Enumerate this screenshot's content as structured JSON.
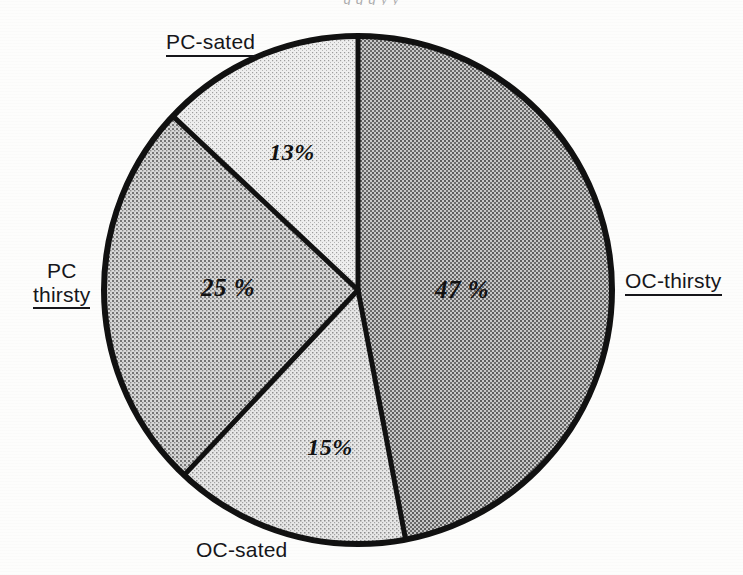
{
  "figure": {
    "top_cutoff_text": "g g  g      y  y",
    "background_color": "#fdfdfc",
    "outline_color": "#111111",
    "width": 743,
    "height": 575
  },
  "geometry": {
    "center_x": 358,
    "center_y": 290,
    "radius": 254,
    "outline_width": 6
  },
  "chart_data": {
    "type": "pie",
    "title": "",
    "categories": [
      "OC-thirsty",
      "OC-sated",
      "PC-thirsty",
      "PC-sated"
    ],
    "values": [
      47,
      15,
      25,
      13
    ],
    "value_labels": [
      "47 %",
      "15%",
      "25 %",
      "13%"
    ],
    "unit": "%",
    "start_angle_deg": 0,
    "direction": "clockwise",
    "legend": "none",
    "grid": false,
    "slices": [
      {
        "name": "OC-thirsty",
        "value": 47,
        "value_label": "47 %",
        "fill": "#9b9b9b",
        "pattern": "coarse-halftone-dark",
        "start_deg": 0,
        "end_deg": 169.2,
        "label_x": 462,
        "label_y": 290,
        "label_underline": true,
        "label_pos_x": 625,
        "label_pos_y": 269,
        "label_align": "left",
        "label_lines": [
          "OC-thirsty"
        ]
      },
      {
        "name": "OC-sated",
        "value": 15,
        "value_label": "15%",
        "fill": "#cfcfcf",
        "pattern": "fine-halftone-light",
        "start_deg": 169.2,
        "end_deg": 223.2,
        "label_x": 330,
        "label_y": 447,
        "label_underline": false,
        "label_pos_x": 196,
        "label_pos_y": 538,
        "label_align": "left",
        "label_lines": [
          "OC-sated"
        ]
      },
      {
        "name": "PC-thirsty",
        "value": 25,
        "value_label": "25 %",
        "fill": "#b4b4b4",
        "pattern": "medium-halftone",
        "start_deg": 223.2,
        "end_deg": 313.2,
        "label_x": 228,
        "label_y": 288,
        "label_underline": true,
        "label_pos_x": 33,
        "label_pos_y": 259,
        "label_align": "center",
        "label_lines": [
          "PC",
          "thirsty"
        ]
      },
      {
        "name": "PC-sated",
        "value": 13,
        "value_label": "13%",
        "fill": "#dedede",
        "pattern": "fine-halftone-lightest",
        "start_deg": 313.2,
        "end_deg": 360,
        "label_x": 292,
        "label_y": 152,
        "label_underline": true,
        "label_pos_x": 166,
        "label_pos_y": 30,
        "label_align": "left",
        "label_lines": [
          "PC-sated"
        ]
      }
    ]
  }
}
